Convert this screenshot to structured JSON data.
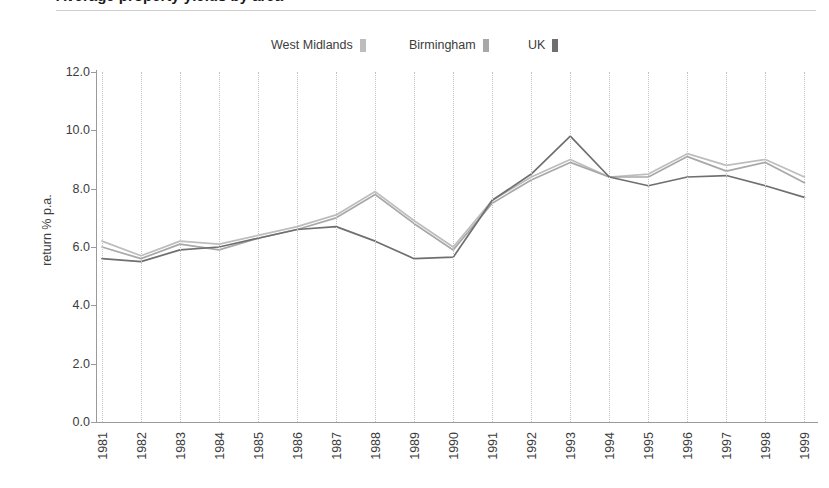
{
  "header": {
    "title_cropped": "Average property yields by area",
    "rule_color": "#cfcfcf"
  },
  "legend": {
    "position": "top-center",
    "items": [
      {
        "label": "West Midlands",
        "color": "#bdbdbd"
      },
      {
        "label": "Birmingham",
        "color": "#a8a8a8"
      },
      {
        "label": "UK",
        "color": "#6f6f6f"
      }
    ]
  },
  "chart_data": {
    "type": "line",
    "title": "Average property yields by area",
    "xlabel": "",
    "ylabel": "return % p.a.",
    "x": [
      1981,
      1982,
      1983,
      1984,
      1985,
      1986,
      1987,
      1988,
      1989,
      1990,
      1991,
      1992,
      1993,
      1994,
      1995,
      1996,
      1997,
      1998,
      1999
    ],
    "xtick_labels": [
      "1981",
      "1982",
      "1983",
      "1984",
      "1985",
      "1986",
      "1987",
      "1988",
      "1989",
      "1990",
      "1991",
      "1992",
      "1993",
      "1994",
      "1995",
      "1996",
      "1997",
      "1998",
      "1999"
    ],
    "ytick_labels": [
      "0.0",
      "2.0",
      "4.0",
      "6.0",
      "8.0",
      "10.0",
      "12.0"
    ],
    "ytick_values": [
      0.0,
      2.0,
      4.0,
      6.0,
      8.0,
      10.0,
      12.0
    ],
    "ylim": [
      0.0,
      12.0
    ],
    "grid": {
      "vertical": true,
      "horizontal": false,
      "style": "dotted"
    },
    "legend_position": "top-center",
    "series": [
      {
        "name": "West Midlands",
        "color": "#bdbdbd",
        "values": [
          6.2,
          5.7,
          6.2,
          6.1,
          6.4,
          6.7,
          7.1,
          7.9,
          6.9,
          6.0,
          7.6,
          8.4,
          9.0,
          8.4,
          8.5,
          9.2,
          8.8,
          9.0,
          8.4
        ]
      },
      {
        "name": "Birmingham",
        "color": "#a8a8a8",
        "values": [
          6.0,
          5.6,
          6.1,
          5.9,
          6.3,
          6.6,
          7.0,
          7.8,
          6.8,
          5.9,
          7.5,
          8.3,
          8.9,
          8.4,
          8.4,
          9.1,
          8.6,
          8.9,
          8.2
        ]
      },
      {
        "name": "UK",
        "color": "#6f6f6f",
        "values": [
          5.6,
          5.5,
          5.9,
          6.0,
          6.3,
          6.6,
          6.7,
          6.2,
          5.6,
          5.65,
          7.6,
          8.5,
          9.8,
          8.4,
          8.1,
          8.4,
          8.45,
          8.1,
          7.7
        ]
      }
    ]
  }
}
